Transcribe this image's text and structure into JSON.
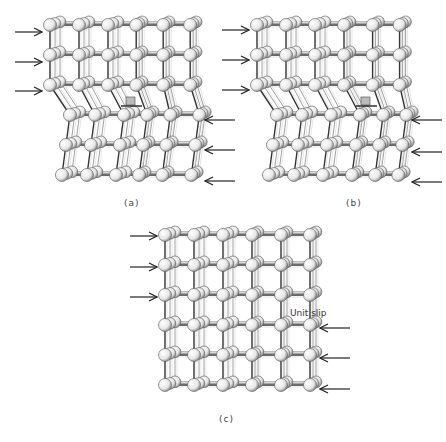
{
  "figure": {
    "panels": [
      {
        "id": "a",
        "caption": "(a)",
        "origin": [
          50,
          25
        ],
        "cols": 6,
        "rows": 6,
        "dx": 29,
        "dy": 30,
        "left_arrows_y": [
          32,
          62,
          91
        ],
        "right_arrows_y": [
          120,
          150,
          181
        ],
        "dislocation_col": 2.6,
        "dislocation_symbol": "edge-dislocation (⊥)",
        "symbol_pos": [
          130,
          105
        ]
      },
      {
        "id": "b",
        "caption": "(b)",
        "origin": [
          257,
          25
        ],
        "cols": 6,
        "rows": 6,
        "dx": 29,
        "dy": 30,
        "left_arrows_y": [
          30,
          60,
          90
        ],
        "right_arrows_y": [
          120,
          152,
          182
        ],
        "dislocation_col": 3.8,
        "dislocation_symbol": "edge-dislocation (⊥)",
        "symbol_pos": [
          365,
          105
        ]
      },
      {
        "id": "c",
        "caption": "(c)",
        "origin": [
          165,
          235
        ],
        "cols": 6,
        "rows": 6,
        "dx": 29,
        "dy": 30,
        "left_arrows_y": [
          236,
          267,
          297
        ],
        "right_arrows_y": [
          328,
          358,
          389
        ],
        "annotation": "Unit slip"
      }
    ]
  },
  "labels": {
    "a": "(a)",
    "b": "(b)",
    "c": "(c)",
    "unit_slip": "Unit slip"
  },
  "colors": {
    "atom_fill": "#f2f2f2",
    "atom_stroke": "#555555",
    "bond": "#333333",
    "bond_light": "#888888",
    "arrow": "#222222",
    "symbol_fill": "#bbbbbb"
  }
}
